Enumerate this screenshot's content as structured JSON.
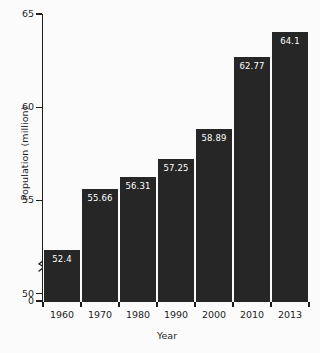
{
  "chart_data": {
    "type": "bar",
    "title": "",
    "xlabel": "Year",
    "ylabel": "Population (million)",
    "categories": [
      "1960",
      "1970",
      "1980",
      "1990",
      "2000",
      "2010",
      "2013"
    ],
    "values": [
      52.4,
      55.66,
      56.31,
      57.25,
      58.89,
      62.77,
      64.1
    ],
    "value_labels": [
      "52.4",
      "55.66",
      "56.31",
      "57.25",
      "58.89",
      "62.77",
      "64.1"
    ],
    "series": [
      {
        "name": "Population",
        "values": [
          52.4,
          55.66,
          56.31,
          57.25,
          58.89,
          62.77,
          64.1
        ]
      }
    ],
    "ylim": [
      49.6,
      65
    ],
    "y_axis_break": true,
    "y_axis_break_between": [
      0,
      50
    ],
    "ytick_labels": [
      "0",
      "50",
      "55",
      "60",
      "65"
    ],
    "ytick_values": [
      0,
      50,
      55,
      60,
      65
    ],
    "grid": false,
    "legend": false,
    "legend_position": "none",
    "bar_color": "#262626",
    "label_color": "#ffffff",
    "axis_color": "#1d1d1d",
    "background_color": "#fbfbfb"
  }
}
